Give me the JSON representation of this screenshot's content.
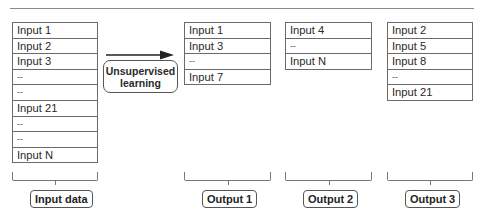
{
  "diagram": {
    "input_table": {
      "rows": [
        "Input 1",
        "Input 2",
        "Input 3",
        "--",
        "--",
        "Input 21",
        "--",
        "--",
        "Input N"
      ],
      "label": "Input data"
    },
    "process": {
      "line1": "Unsupervised",
      "line2": "learning",
      "arrow_icon": "right-arrow-icon"
    },
    "outputs": [
      {
        "rows": [
          "Input 1",
          "Input 3",
          "--",
          "Input 7"
        ],
        "label": "Output 1"
      },
      {
        "rows": [
          "Input 4",
          "--",
          "Input N"
        ],
        "label": "Output 2"
      },
      {
        "rows": [
          "Input 2",
          "Input 5",
          "Input 8",
          "--",
          "Input 21"
        ],
        "label": "Output 3"
      }
    ],
    "colors": {
      "border": "#6a6a6a",
      "text": "#2a2a2a",
      "background": "#ffffff"
    }
  }
}
